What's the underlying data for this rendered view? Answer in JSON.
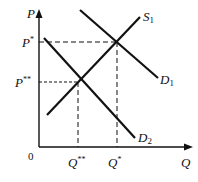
{
  "diagram": {
    "type": "supply-demand",
    "axes": {
      "y_label": "P",
      "x_label": "Q",
      "origin_label": "0"
    },
    "curves": [
      {
        "name": "S",
        "subscript": "1",
        "kind": "supply"
      },
      {
        "name": "D",
        "subscript": "1",
        "kind": "demand"
      },
      {
        "name": "D",
        "subscript": "2",
        "kind": "demand"
      }
    ],
    "price_levels": [
      {
        "label": "P",
        "superscript": "*"
      },
      {
        "label": "P",
        "superscript": "**"
      }
    ],
    "quantity_levels": [
      {
        "label": "Q",
        "superscript": "**"
      },
      {
        "label": "Q",
        "superscript": "*"
      }
    ]
  }
}
